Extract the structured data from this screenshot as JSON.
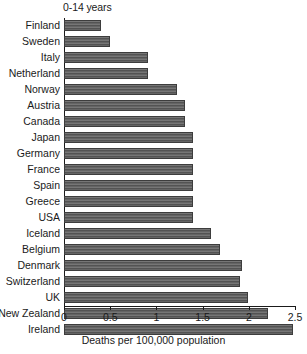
{
  "chart_data": {
    "type": "bar",
    "orientation": "horizontal",
    "title": "0-14 years",
    "xlabel": "Deaths per 100,000 population",
    "ylabel": "",
    "xlim": [
      0,
      2.5
    ],
    "xticks": [
      "0",
      "0.5",
      "1",
      "1.5",
      "2",
      "2.5"
    ],
    "xtick_values": [
      0,
      0.5,
      1,
      1.5,
      2,
      2.5
    ],
    "grid": false,
    "legend": false,
    "bar_color": "#5c5c5c",
    "categories": [
      "Finland",
      "Sweden",
      "Italy",
      "Netherland",
      "Norway",
      "Austria",
      "Canada",
      "Japan",
      "Germany",
      "France",
      "Spain",
      "Greece",
      "USA",
      "Iceland",
      "Belgium",
      "Denmark",
      "Switzerland",
      "UK",
      "New Zealand",
      "Ireland"
    ],
    "values": [
      0.4,
      0.5,
      0.91,
      0.91,
      1.22,
      1.31,
      1.31,
      1.4,
      1.4,
      1.4,
      1.4,
      1.4,
      1.4,
      1.59,
      1.69,
      1.93,
      1.9,
      1.99,
      2.21,
      2.48
    ]
  }
}
